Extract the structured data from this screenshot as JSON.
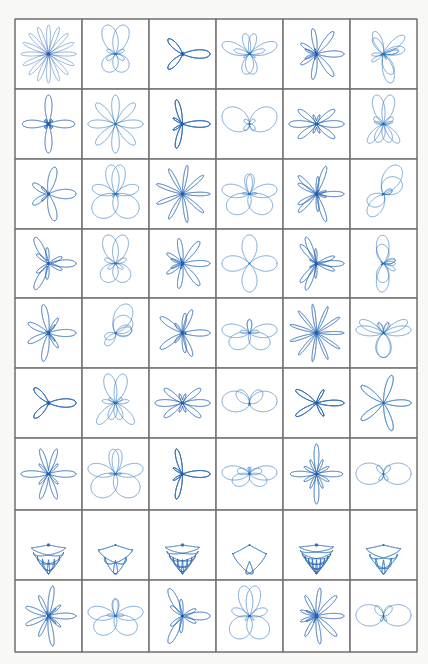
{
  "page": {
    "title": "",
    "columns": 6,
    "rows": 9,
    "colors": {
      "line": "#2f74c0",
      "line_dense": "#1f5fae",
      "border": "#6e6e6e",
      "paper": "#ffffff"
    }
  },
  "figures": [
    {
      "row": 1,
      "col": 1,
      "kind": "rose",
      "k": 8,
      "petals_note": "dense star rose, 16 thin petals"
    },
    {
      "row": 1,
      "col": 2,
      "kind": "liss",
      "a": 2,
      "b": 3,
      "phase": 0.0,
      "note": "butterfly X"
    },
    {
      "row": 1,
      "col": 3,
      "kind": "rose2",
      "k1": 3,
      "k2": 5,
      "note": "layered X rose"
    },
    {
      "row": 1,
      "col": 4,
      "kind": "liss",
      "a": 3,
      "b": 4,
      "phase": 0.3,
      "note": "butterfly"
    },
    {
      "row": 1,
      "col": 5,
      "kind": "rose2",
      "k1": 4,
      "k2": 7,
      "note": "dense butterfly"
    },
    {
      "row": 1,
      "col": 6,
      "kind": "liss",
      "a": 3,
      "b": 5,
      "phase": 0.4,
      "note": "butterfly"
    },
    {
      "row": 2,
      "col": 1,
      "kind": "rose2",
      "k1": 2,
      "k2": 6,
      "note": "X with petals"
    },
    {
      "row": 2,
      "col": 2,
      "kind": "rose",
      "k": 4,
      "note": "8-petal flower"
    },
    {
      "row": 2,
      "col": 3,
      "kind": "rose2",
      "k1": 3,
      "k2": 7,
      "note": "dense X"
    },
    {
      "row": 2,
      "col": 4,
      "kind": "liss",
      "a": 1,
      "b": 2,
      "phase": 0.0,
      "note": "simple X loops"
    },
    {
      "row": 2,
      "col": 5,
      "kind": "rose2",
      "k1": 4,
      "k2": 6,
      "note": "dense flower"
    },
    {
      "row": 2,
      "col": 6,
      "kind": "liss",
      "a": 2,
      "b": 5,
      "phase": 0.2,
      "note": "butterfly"
    },
    {
      "row": 3,
      "col": 1,
      "kind": "rose2",
      "k1": 2,
      "k2": 5,
      "note": "X butterfly"
    },
    {
      "row": 3,
      "col": 2,
      "kind": "liss",
      "a": 2,
      "b": 3,
      "phase": 0.5,
      "note": "butterfly"
    },
    {
      "row": 3,
      "col": 3,
      "kind": "rose",
      "k": 9,
      "note": "round chrysanthemum"
    },
    {
      "row": 3,
      "col": 4,
      "kind": "liss",
      "a": 2,
      "b": 3,
      "phase": 0.8,
      "note": "butterfly"
    },
    {
      "row": 3,
      "col": 5,
      "kind": "rose2",
      "k1": 5,
      "k2": 8,
      "note": "dense butterfly"
    },
    {
      "row": 3,
      "col": 6,
      "kind": "liss",
      "a": 1,
      "b": 3,
      "phase": 0.2,
      "note": "X"
    },
    {
      "row": 4,
      "col": 1,
      "kind": "rose2",
      "k1": 3,
      "k2": 6,
      "note": "butterfly"
    },
    {
      "row": 4,
      "col": 2,
      "kind": "liss",
      "a": 2,
      "b": 3,
      "phase": 0.1,
      "note": "butterfly"
    },
    {
      "row": 4,
      "col": 3,
      "kind": "rose2",
      "k1": 4,
      "k2": 7,
      "note": "dense butterfly"
    },
    {
      "row": 4,
      "col": 4,
      "kind": "rose",
      "k": 2,
      "note": "4-petal clover"
    },
    {
      "row": 4,
      "col": 5,
      "kind": "rose2",
      "k1": 3,
      "k2": 8,
      "note": "dense butterfly"
    },
    {
      "row": 4,
      "col": 6,
      "kind": "liss",
      "a": 2,
      "b": 4,
      "phase": 0.3,
      "note": "butterfly"
    },
    {
      "row": 5,
      "col": 1,
      "kind": "rose2",
      "k1": 2,
      "k2": 7,
      "note": "dense X"
    },
    {
      "row": 5,
      "col": 2,
      "kind": "liss",
      "a": 1,
      "b": 3,
      "phase": 0.6,
      "note": "loops"
    },
    {
      "row": 5,
      "col": 3,
      "kind": "rose2",
      "k1": 5,
      "k2": 6,
      "note": "dense flower"
    },
    {
      "row": 5,
      "col": 4,
      "kind": "liss",
      "a": 2,
      "b": 3,
      "phase": 1.0,
      "note": "butterfly"
    },
    {
      "row": 5,
      "col": 5,
      "kind": "rose",
      "k": 11,
      "note": "round dense rose"
    },
    {
      "row": 5,
      "col": 6,
      "kind": "liss",
      "a": 3,
      "b": 4,
      "phase": 0.9,
      "note": "butterfly"
    },
    {
      "row": 6,
      "col": 1,
      "kind": "rose2",
      "k1": 3,
      "k2": 5,
      "note": "dense butterfly"
    },
    {
      "row": 6,
      "col": 2,
      "kind": "liss",
      "a": 2,
      "b": 5,
      "phase": 0.4,
      "note": "X with petals"
    },
    {
      "row": 6,
      "col": 3,
      "kind": "rose2",
      "k1": 4,
      "k2": 6,
      "note": "dense flower"
    },
    {
      "row": 6,
      "col": 4,
      "kind": "liss",
      "a": 1,
      "b": 2,
      "phase": 1.2,
      "note": "loop with tails"
    },
    {
      "row": 6,
      "col": 5,
      "kind": "rose2",
      "k1": 5,
      "k2": 7,
      "note": "dense flower"
    },
    {
      "row": 6,
      "col": 6,
      "kind": "rose",
      "k": 5,
      "note": "round 10-petal rose"
    },
    {
      "row": 7,
      "col": 1,
      "kind": "rose2",
      "k1": 2,
      "k2": 8,
      "note": "dense butterfly"
    },
    {
      "row": 7,
      "col": 2,
      "kind": "liss",
      "a": 2,
      "b": 3,
      "phase": 0.7,
      "note": "butterfly"
    },
    {
      "row": 7,
      "col": 3,
      "kind": "rose2",
      "k1": 3,
      "k2": 7,
      "note": "dense flower"
    },
    {
      "row": 7,
      "col": 4,
      "kind": "liss",
      "a": 2,
      "b": 3,
      "phase": 1.3,
      "note": "butterfly"
    },
    {
      "row": 7,
      "col": 5,
      "kind": "rose2",
      "k1": 4,
      "k2": 8,
      "note": "dense flower"
    },
    {
      "row": 7,
      "col": 6,
      "kind": "liss",
      "a": 1,
      "b": 2,
      "phase": 1.5,
      "note": "arches"
    },
    {
      "row": 8,
      "col": 1,
      "kind": "cyl",
      "n": 9,
      "note": "hourglass cylinder"
    },
    {
      "row": 8,
      "col": 2,
      "kind": "cyl",
      "n": 5,
      "note": "hourglass cylinder"
    },
    {
      "row": 8,
      "col": 3,
      "kind": "cyl",
      "n": 11,
      "note": "hourglass cylinder dense"
    },
    {
      "row": 8,
      "col": 4,
      "kind": "cyl",
      "n": 3,
      "note": "simple hourglass"
    },
    {
      "row": 8,
      "col": 5,
      "kind": "cyl",
      "n": 13,
      "note": "hourglass cylinder dense"
    },
    {
      "row": 8,
      "col": 6,
      "kind": "cyl",
      "n": 7,
      "note": "hourglass cylinder"
    },
    {
      "row": 9,
      "col": 1,
      "kind": "rose2",
      "k1": 2,
      "k2": 9,
      "note": "dense X star"
    },
    {
      "row": 9,
      "col": 2,
      "kind": "liss",
      "a": 2,
      "b": 3,
      "phase": 0.9,
      "note": "butterfly"
    },
    {
      "row": 9,
      "col": 3,
      "kind": "rose2",
      "k1": 3,
      "k2": 6,
      "note": "dense flower"
    },
    {
      "row": 9,
      "col": 4,
      "kind": "liss",
      "a": 2,
      "b": 3,
      "phase": 0.35,
      "note": "butterfly"
    },
    {
      "row": 9,
      "col": 5,
      "kind": "rose2",
      "k1": 4,
      "k2": 9,
      "note": "dense flower"
    },
    {
      "row": 9,
      "col": 6,
      "kind": "liss",
      "a": 1,
      "b": 2,
      "phase": 1.4,
      "note": "arches with tails"
    }
  ]
}
